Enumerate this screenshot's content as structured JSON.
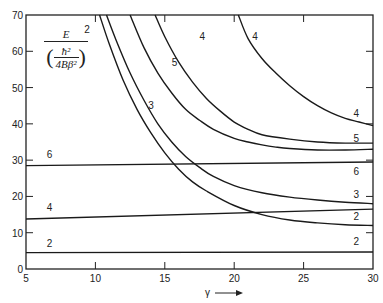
{
  "chart_data": {
    "type": "line",
    "title": "",
    "xlabel": "γ",
    "ylabel": "E / (ħ² / 4Bβ²)",
    "ylabel_parts": {
      "numerator": "E",
      "inner_num": "ħ²",
      "inner_den": "4Bβ²"
    },
    "xlim": [
      5,
      30
    ],
    "ylim": [
      0,
      70
    ],
    "xticks": [
      5,
      10,
      15,
      20,
      25,
      30
    ],
    "yticks": [
      0,
      10,
      20,
      30,
      40,
      50,
      60,
      70
    ],
    "grid": false,
    "legend": "inline curve labels",
    "series": [
      {
        "name": "2 (flat)",
        "label": "2",
        "x": [
          5,
          30
        ],
        "y": [
          4.5,
          4.7
        ],
        "label_left": {
          "x": 6.5,
          "y": 6
        },
        "label_right": {
          "x": 28.6,
          "y": 6.5
        }
      },
      {
        "name": "4 (flat)",
        "label": "4",
        "x": [
          5,
          30
        ],
        "y": [
          13.8,
          16.5
        ],
        "label_left": {
          "x": 6.5,
          "y": 16
        }
      },
      {
        "name": "6 (flat)",
        "label": "6",
        "x": [
          5,
          30
        ],
        "y": [
          28.5,
          29.5
        ],
        "label_left": {
          "x": 6.5,
          "y": 30.5
        },
        "label_right": {
          "x": 28.6,
          "y": 26
        }
      },
      {
        "name": "2 (curve)",
        "label": "2",
        "x": [
          10.3,
          11,
          12,
          13,
          14,
          15,
          16,
          17,
          18,
          20,
          22,
          24,
          26,
          28,
          30
        ],
        "y": [
          70,
          62,
          52,
          44,
          37.5,
          32,
          27.5,
          24,
          21.5,
          17.5,
          15,
          13.5,
          12.7,
          12.2,
          12
        ],
        "label_left": {
          "x": 9.2,
          "y": 65
        },
        "label_right": {
          "x": 28.6,
          "y": 13.5
        }
      },
      {
        "name": "3 (curve)",
        "label": "3",
        "x": [
          10.8,
          11.5,
          12.5,
          13.5,
          14.5,
          15.5,
          16.5,
          17.5,
          18.5,
          20,
          22,
          24,
          26,
          28,
          30
        ],
        "y": [
          70,
          63,
          54,
          46.5,
          40,
          35,
          31,
          28,
          25.5,
          23,
          21,
          19.8,
          19,
          18.4,
          18
        ],
        "label_left": {
          "x": 13.8,
          "y": 44
        },
        "label_right": {
          "x": 28.6,
          "y": 19.5
        }
      },
      {
        "name": "5 (curve)",
        "label": "5",
        "x": [
          12.5,
          13.5,
          14.5,
          15.5,
          16.5,
          17.5,
          18.5,
          20,
          21,
          22,
          23,
          24,
          26,
          28,
          30
        ],
        "y": [
          70,
          61,
          54,
          48.5,
          44,
          41,
          38.5,
          36,
          35,
          34.2,
          33.6,
          33.2,
          32.8,
          32.8,
          33
        ],
        "label_left": {
          "x": 15.5,
          "y": 56
        },
        "label_right": {
          "x": 28.6,
          "y": 35
        }
      },
      {
        "name": "4 (curve-mid)",
        "label": "4",
        "x": [
          14.3,
          15,
          16,
          17,
          18,
          19,
          20,
          21,
          22,
          24,
          26,
          28,
          30
        ],
        "y": [
          70,
          64,
          57,
          51.5,
          47,
          43.5,
          40.5,
          38.5,
          37,
          35.8,
          35,
          34.7,
          34.7
        ],
        "label_left": {
          "x": 17.5,
          "y": 63
        }
      },
      {
        "name": "4 (curve-upper)",
        "label": "4",
        "x": [
          20.3,
          21,
          22,
          23,
          24,
          25,
          26,
          27,
          28,
          29,
          30
        ],
        "y": [
          70,
          63.5,
          58,
          54,
          50.5,
          47.5,
          45,
          43,
          41.5,
          40.5,
          39.5
        ],
        "label_left": {
          "x": 21.3,
          "y": 63
        },
        "label_right": {
          "x": 28.6,
          "y": 42
        }
      }
    ]
  },
  "axis_arrow_label": "γ"
}
